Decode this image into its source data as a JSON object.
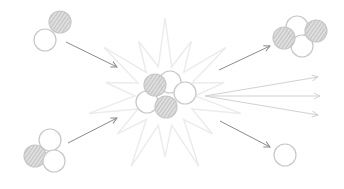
{
  "diagram": {
    "type": "nuclear-fusion-reaction",
    "description": "Deuterium and tritium nuclei fuse, producing a helium nucleus, a free neutron and energy (rays)",
    "colors": {
      "background": "#ffffff",
      "particle_stroke": "#c8c8c8",
      "proton_hatch": "#b4b4b4",
      "neutron_fill": "#ffffff",
      "arrow": "#8a8a8a",
      "burst": "#ececec",
      "energy_rays": "#d2d2d2"
    },
    "particle_radius": 11,
    "nuclei": [
      {
        "name": "deuterium",
        "role": "reactant",
        "particles": [
          {
            "kind": "proton",
            "x": 60,
            "y": 22
          },
          {
            "kind": "neutron",
            "x": 45,
            "y": 40
          }
        ]
      },
      {
        "name": "tritium",
        "role": "reactant",
        "particles": [
          {
            "kind": "neutron",
            "x": 50,
            "y": 140
          },
          {
            "kind": "proton",
            "x": 35,
            "y": 156
          },
          {
            "kind": "neutron",
            "x": 54,
            "y": 161
          }
        ]
      },
      {
        "name": "compound-nucleus",
        "role": "intermediate",
        "particles": [
          {
            "kind": "neutron",
            "x": 147,
            "y": 102
          },
          {
            "kind": "neutron",
            "x": 170,
            "y": 82
          },
          {
            "kind": "neutron",
            "x": 185,
            "y": 93
          },
          {
            "kind": "proton",
            "x": 155,
            "y": 85
          },
          {
            "kind": "proton",
            "x": 166,
            "y": 107
          }
        ]
      },
      {
        "name": "helium",
        "role": "product",
        "particles": [
          {
            "kind": "neutron",
            "x": 297,
            "y": 27
          },
          {
            "kind": "neutron",
            "x": 302,
            "y": 46
          },
          {
            "kind": "proton",
            "x": 284,
            "y": 38
          },
          {
            "kind": "proton",
            "x": 316,
            "y": 31
          }
        ]
      },
      {
        "name": "free-neutron",
        "role": "product",
        "particles": [
          {
            "kind": "neutron",
            "x": 285,
            "y": 155
          }
        ]
      }
    ],
    "arrows": [
      {
        "name": "deuterium-in",
        "x1": 66,
        "y1": 42,
        "x2": 117,
        "y2": 67
      },
      {
        "name": "tritium-in",
        "x1": 68,
        "y1": 143,
        "x2": 117,
        "y2": 118
      },
      {
        "name": "helium-out",
        "x1": 219,
        "y1": 70,
        "x2": 270,
        "y2": 46
      },
      {
        "name": "neutron-out",
        "x1": 220,
        "y1": 121,
        "x2": 270,
        "y2": 147
      }
    ],
    "energy_rays": [
      {
        "x1": 205,
        "y1": 96,
        "x2": 318,
        "y2": 77
      },
      {
        "x1": 205,
        "y1": 96,
        "x2": 320,
        "y2": 96
      },
      {
        "x1": 205,
        "y1": 96,
        "x2": 318,
        "y2": 115
      }
    ],
    "burst": {
      "cx": 165,
      "cy": 96,
      "outer": 78,
      "inner": 30,
      "spikes": 14
    }
  }
}
